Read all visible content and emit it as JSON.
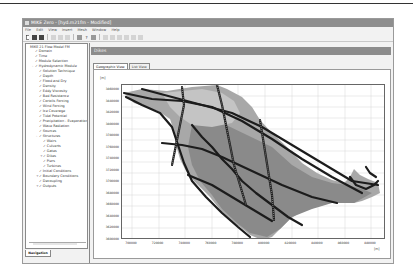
{
  "window": {
    "title": "MIKE Zero - [hyd.m21fm - Modified]",
    "menu": [
      "File",
      "Edit",
      "View",
      "Insert",
      "Mesh",
      "Window",
      "Help"
    ],
    "toolbar": {
      "buttons": [
        "new-file",
        "open",
        "save",
        "cut",
        "copy",
        "paste",
        "print",
        "help",
        "whats-this",
        "zoom-in",
        "zoom-out",
        "pan",
        "previous-view",
        "next-view",
        "refresh"
      ]
    }
  },
  "navigation": {
    "tab_label": "Navigation",
    "root": "MIKE 21 Flow Model FM",
    "items": [
      {
        "label": "Domain",
        "level": 1,
        "checked": true,
        "expander": ""
      },
      {
        "label": "Time",
        "level": 1,
        "checked": true,
        "expander": ""
      },
      {
        "label": "Module Selection",
        "level": 1,
        "checked": true,
        "expander": ""
      },
      {
        "label": "Hydrodynamic Module",
        "level": 1,
        "checked": true,
        "expander": "-"
      },
      {
        "label": "Solution Technique",
        "level": 2,
        "checked": true,
        "expander": ""
      },
      {
        "label": "Depth",
        "level": 2,
        "checked": true,
        "expander": ""
      },
      {
        "label": "Flood and Dry",
        "level": 2,
        "checked": true,
        "expander": ""
      },
      {
        "label": "Density",
        "level": 2,
        "checked": true,
        "expander": ""
      },
      {
        "label": "Eddy Viscosity",
        "level": 2,
        "checked": true,
        "expander": ""
      },
      {
        "label": "Bed Resistance",
        "level": 2,
        "checked": true,
        "expander": ""
      },
      {
        "label": "Coriolis Forcing",
        "level": 2,
        "checked": true,
        "expander": ""
      },
      {
        "label": "Wind Forcing",
        "level": 2,
        "checked": true,
        "expander": ""
      },
      {
        "label": "Ice Coverage",
        "level": 2,
        "checked": true,
        "expander": ""
      },
      {
        "label": "Tidal Potential",
        "level": 2,
        "checked": true,
        "expander": ""
      },
      {
        "label": "Precipitation - Evaporation",
        "level": 2,
        "checked": true,
        "expander": ""
      },
      {
        "label": "Wave Radiation",
        "level": 2,
        "checked": true,
        "expander": ""
      },
      {
        "label": "Sources",
        "level": 2,
        "checked": true,
        "expander": ""
      },
      {
        "label": "Structures",
        "level": 2,
        "checked": true,
        "expander": "-"
      },
      {
        "label": "Weirs",
        "level": 3,
        "checked": true,
        "expander": ""
      },
      {
        "label": "Culverts",
        "level": 3,
        "checked": true,
        "expander": ""
      },
      {
        "label": "Gates",
        "level": 3,
        "checked": true,
        "expander": ""
      },
      {
        "label": "Dikes",
        "level": 3,
        "checked": true,
        "expander": "+"
      },
      {
        "label": "Piers",
        "level": 3,
        "checked": true,
        "expander": ""
      },
      {
        "label": "Turbines",
        "level": 3,
        "checked": true,
        "expander": ""
      },
      {
        "label": "Initial Conditions",
        "level": 2,
        "checked": true,
        "expander": ""
      },
      {
        "label": "Boundary Conditions",
        "level": 2,
        "checked": true,
        "expander": "+"
      },
      {
        "label": "Decoupling",
        "level": 2,
        "checked": true,
        "expander": ""
      },
      {
        "label": "Outputs",
        "level": 2,
        "checked": true,
        "expander": "+"
      }
    ]
  },
  "main": {
    "panel_title": "Dikes",
    "tabs": [
      {
        "label": "Geographic View",
        "active": true
      },
      {
        "label": "List View",
        "active": false
      }
    ],
    "y_unit": "[m]",
    "x_unit": "[m]",
    "y_ticks": [
      "3860000",
      "3840000",
      "3820000",
      "3800000",
      "3780000",
      "3760000",
      "3740000",
      "3720000",
      "3700000",
      "3680000",
      "3660000",
      "3640000",
      "3620000",
      "3600000"
    ],
    "x_ticks": [
      "700000",
      "720000",
      "740000",
      "760000",
      "780000",
      "800000",
      "820000",
      "840000",
      "860000",
      "880000"
    ]
  },
  "colors": {
    "titlebar": "#8e8e8e",
    "panel_title": "#8c8c8c",
    "domain_light": "#b5b5b5",
    "domain_mid": "#9a9a9a",
    "domain_dark": "#7e7e7e",
    "dike_lines": "#1e1e1e",
    "grid": "#d0d0d0"
  }
}
